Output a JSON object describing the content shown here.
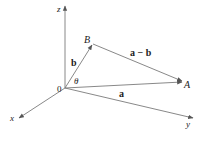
{
  "diagram": {
    "colors": {
      "line": "#7a7a7a",
      "text": "#222222",
      "background": "#ffffff"
    },
    "points": {
      "origin": {
        "label": "0",
        "x": 65,
        "y": 88
      },
      "A": {
        "label": "A",
        "x": 183,
        "y": 82
      },
      "B": {
        "label": "B",
        "x": 92,
        "y": 44
      }
    },
    "axes": {
      "x": {
        "label": "x"
      },
      "y": {
        "label": "y"
      },
      "z": {
        "label": "z"
      }
    },
    "vectors": {
      "a": {
        "label": "a"
      },
      "b": {
        "label": "b"
      },
      "a_minus_b": {
        "label": "a − b"
      }
    },
    "angle": {
      "label": "θ"
    }
  }
}
